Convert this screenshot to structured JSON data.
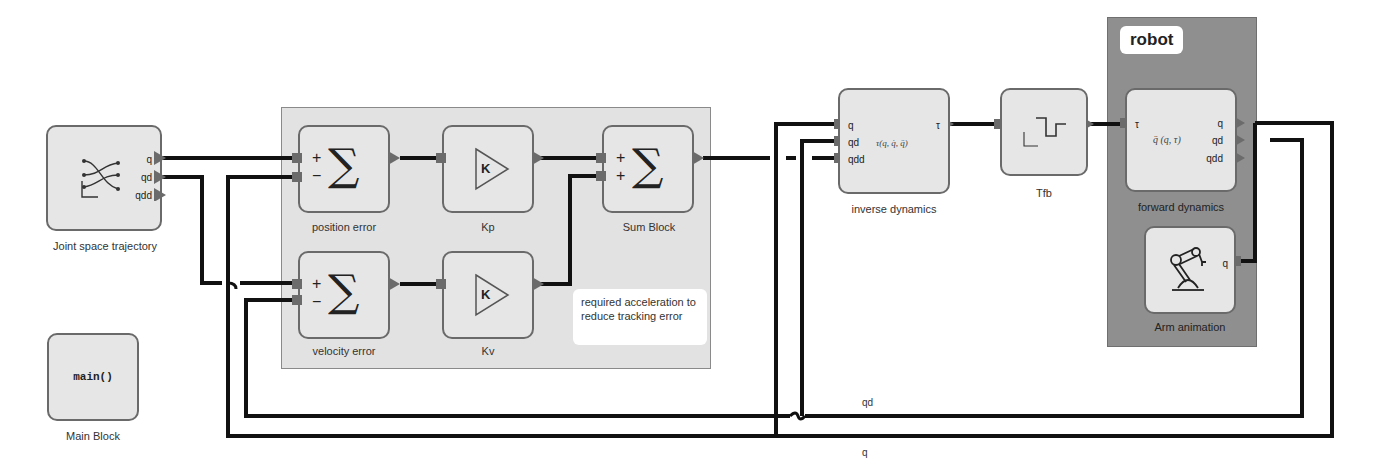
{
  "blocks": {
    "trajectory": {
      "label": "Joint space trajectory",
      "ports_out": [
        "q",
        "qd",
        "qdd"
      ]
    },
    "main": {
      "label": "Main Block",
      "code": "main()"
    },
    "position_error": {
      "label": "position error",
      "signs": [
        "+",
        "−"
      ],
      "symbol": "∑"
    },
    "kp": {
      "label": "Kp",
      "symbol": "K"
    },
    "sum_block": {
      "label": "Sum Block",
      "signs": [
        "+",
        "+"
      ],
      "symbol": "∑"
    },
    "velocity_error": {
      "label": "velocity error",
      "signs": [
        "+",
        "−"
      ],
      "symbol": "∑"
    },
    "kv": {
      "label": "Kv",
      "symbol": "K"
    },
    "inverse_dynamics": {
      "label": "inverse dynamics",
      "ports_in": [
        "q",
        "qd",
        "qdd"
      ],
      "port_out": "τ",
      "formula": "τ(q, q̇, q̈)"
    },
    "tfb": {
      "label": "Tfb"
    },
    "forward_dynamics": {
      "label": "forward dynamics",
      "port_in": "τ",
      "ports_out": [
        "q",
        "qd",
        "qdd"
      ],
      "formula": "q̈ (q, τ)"
    },
    "arm_animation": {
      "label": "Arm animation",
      "port_in": "q"
    }
  },
  "note": {
    "text": "required acceleration to reduce tracking error"
  },
  "robot_group": {
    "title": "robot"
  },
  "wire_labels": {
    "qd": "qd",
    "q": "q"
  },
  "colors": {
    "wire": "#111111",
    "port": "#6b6b6b",
    "group_bg": "#e2e2e2",
    "robot_bg": "#8f8f8f",
    "block_bg": "#e6e6e6"
  }
}
